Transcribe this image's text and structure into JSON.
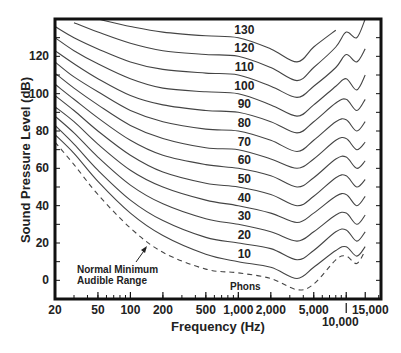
{
  "chart_data": {
    "type": "line",
    "title": "",
    "xlabel": "Frequency (Hz)",
    "ylabel": "Sound Pressure Level (dB)",
    "xscale": "log",
    "xlim": [
      20,
      21000
    ],
    "ylim": [
      -10,
      140
    ],
    "grid": false,
    "legend": "none (curves labeled inline at 1,000 Hz)",
    "x_ticks": [
      20,
      50,
      100,
      200,
      500,
      1000,
      2000,
      5000,
      10000,
      15000
    ],
    "x_tick_labels": [
      "20",
      "50",
      "100",
      "200",
      "500",
      "1,000",
      "2,000",
      "5,000",
      "10,000",
      "15,000"
    ],
    "y_ticks": [
      0,
      20,
      40,
      60,
      80,
      100,
      120
    ],
    "y_tick_labels": [
      "0",
      "20",
      "40",
      "60",
      "80",
      "100",
      "120"
    ],
    "x": [
      20,
      30,
      50,
      100,
      200,
      500,
      1000,
      2000,
      3500,
      5000,
      8000,
      10000,
      12500,
      15000
    ],
    "series": [
      {
        "name": "130",
        "style": "solid",
        "values": [
          null,
          null,
          140,
          136,
          133,
          131,
          130,
          124,
          117,
          125,
          134,
          null,
          null,
          null
        ]
      },
      {
        "name": "120",
        "style": "solid",
        "values": [
          null,
          138,
          133,
          127,
          123,
          121,
          120,
          114,
          107,
          114,
          125,
          133,
          130,
          140
        ]
      },
      {
        "name": "110",
        "style": "solid",
        "values": [
          136,
          130,
          124,
          117,
          113,
          111,
          110,
          104,
          98,
          104,
          114,
          121,
          117,
          124
        ]
      },
      {
        "name": "100",
        "style": "solid",
        "values": [
          130,
          123,
          116,
          108,
          103,
          101,
          100,
          94,
          88,
          94,
          104,
          108,
          102,
          110
        ]
      },
      {
        "name": "90",
        "style": "solid",
        "values": [
          123,
          116,
          108,
          99,
          94,
          91,
          90,
          85,
          79,
          85,
          95,
          97,
          91,
          97
        ]
      },
      {
        "name": "80",
        "style": "solid",
        "values": [
          117,
          109,
          101,
          91,
          85,
          81,
          80,
          75,
          69,
          75,
          85,
          86,
          80,
          85
        ]
      },
      {
        "name": "70",
        "style": "solid",
        "values": [
          111,
          103,
          94,
          83,
          76,
          71,
          70,
          65,
          60,
          65,
          75,
          76,
          70,
          74
        ]
      },
      {
        "name": "60",
        "style": "solid",
        "values": [
          105,
          97,
          87,
          75,
          67,
          62,
          60,
          56,
          50,
          55,
          65,
          66,
          60,
          64
        ]
      },
      {
        "name": "50",
        "style": "solid",
        "values": [
          99,
          91,
          80,
          67,
          58,
          52,
          50,
          46,
          40,
          45,
          55,
          56,
          50,
          54
        ]
      },
      {
        "name": "40",
        "style": "solid",
        "values": [
          93,
          85,
          73,
          59,
          50,
          43,
          40,
          36,
          31,
          36,
          45,
          46,
          40,
          45
        ]
      },
      {
        "name": "30",
        "style": "solid",
        "values": [
          88,
          79,
          66,
          51,
          41,
          33,
          30,
          26,
          21,
          26,
          35,
          36,
          30,
          35
        ]
      },
      {
        "name": "20",
        "style": "solid",
        "values": [
          83,
          73,
          59,
          43,
          32,
          23,
          20,
          17,
          11,
          16,
          26,
          27,
          21,
          26
        ]
      },
      {
        "name": "10",
        "style": "solid",
        "values": [
          78,
          68,
          53,
          36,
          24,
          14,
          10,
          7,
          1,
          7,
          16,
          18,
          13,
          18
        ]
      },
      {
        "name": "Normal Minimum Audible Range",
        "style": "dashed",
        "values": [
          74,
          62,
          46,
          28,
          15,
          6,
          4,
          1,
          -5,
          -2,
          11,
          13,
          9,
          16
        ]
      }
    ],
    "annotations": [
      {
        "text": "Normal Minimum Audible Range",
        "x": 140,
        "y": 18,
        "arrow": true
      },
      {
        "text": "Phons",
        "x": 1000,
        "y": -2
      }
    ],
    "curve_label_position_hz": 1000
  },
  "labels": {
    "xlabel": "Frequency (Hz)",
    "ylabel": "Sound Pressure Level (dB)",
    "annotation_line1": "Normal Minimum",
    "annotation_line2": "Audible Range",
    "phons": "Phons"
  }
}
